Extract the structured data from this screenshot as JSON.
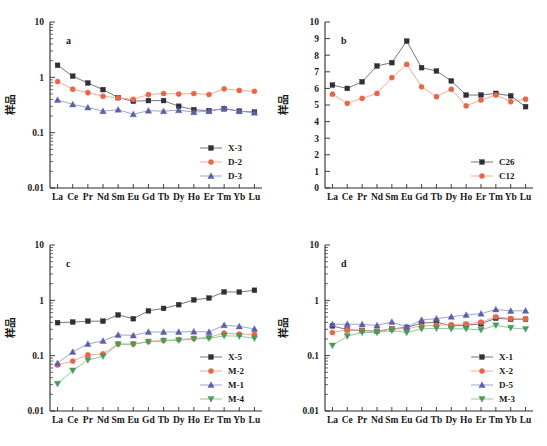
{
  "figure": {
    "axis_title": "样品",
    "categories": [
      "La",
      "Ce",
      "Pr",
      "Nd",
      "Sm",
      "Eu",
      "Gd",
      "Tb",
      "Dy",
      "Ho",
      "Er",
      "Tm",
      "Yb",
      "Lu"
    ],
    "colors": {
      "black": "#2f2f38",
      "red": "#e8674a",
      "blue": "#5a5fa8",
      "green": "#4a9a58",
      "axis": "#2a2a2a",
      "line_black": "#555560",
      "line_red": "#e8956f",
      "line_blue": "#8c90c4",
      "line_green": "#7fba88"
    }
  },
  "chart_data": [
    {
      "type": "line",
      "panel": "a",
      "title": "a",
      "xlabel": "",
      "ylabel": "样品",
      "scale": "log",
      "ylim": [
        0.01,
        10
      ],
      "yticks": [
        0.01,
        0.1,
        1,
        10
      ],
      "ytick_labels": [
        "0.01",
        "0.1",
        "1",
        "10"
      ],
      "categories": [
        "La",
        "Ce",
        "Pr",
        "Nd",
        "Sm",
        "Eu",
        "Gd",
        "Tb",
        "Dy",
        "Ho",
        "Er",
        "Tm",
        "Yb",
        "Lu"
      ],
      "grid": false,
      "legend_position": "bottom-right",
      "series": [
        {
          "name": "X-3",
          "marker": "square",
          "color": "#2f2f38",
          "values": [
            1.65,
            1.05,
            0.79,
            0.6,
            0.43,
            0.37,
            0.38,
            0.38,
            0.3,
            0.26,
            0.25,
            0.27,
            0.245,
            0.235
          ]
        },
        {
          "name": "D-2",
          "marker": "circle",
          "color": "#e8674a",
          "values": [
            0.84,
            0.61,
            0.53,
            0.455,
            0.425,
            0.4,
            0.49,
            0.51,
            0.5,
            0.51,
            0.49,
            0.62,
            0.58,
            0.56
          ]
        },
        {
          "name": "D-3",
          "marker": "triangle",
          "color": "#5a5fa8",
          "values": [
            0.39,
            0.325,
            0.285,
            0.245,
            0.26,
            0.215,
            0.25,
            0.245,
            0.255,
            0.235,
            0.245,
            0.275,
            0.245,
            0.23
          ]
        }
      ]
    },
    {
      "type": "line",
      "panel": "b",
      "title": "b",
      "xlabel": "",
      "ylabel": "样品",
      "scale": "linear",
      "ylim": [
        0,
        10
      ],
      "yticks": [
        0,
        1,
        2,
        3,
        4,
        5,
        6,
        7,
        8,
        9,
        10
      ],
      "ytick_labels": [
        "0",
        "1",
        "2",
        "3",
        "4",
        "5",
        "6",
        "7",
        "8",
        "9",
        "10"
      ],
      "categories": [
        "La",
        "Ce",
        "Pr",
        "Nd",
        "Sm",
        "Eu",
        "Gd",
        "Tb",
        "Dy",
        "Ho",
        "Er",
        "Tm",
        "Yb",
        "Lu"
      ],
      "grid": false,
      "legend_position": "bottom-right",
      "series": [
        {
          "name": "C26",
          "marker": "square",
          "color": "#2f2f38",
          "values": [
            6.2,
            6.0,
            6.4,
            7.35,
            7.55,
            8.85,
            7.25,
            7.05,
            6.45,
            5.6,
            5.6,
            5.7,
            5.55,
            4.9,
            5.6
          ]
        },
        {
          "name": "C12",
          "marker": "circle",
          "color": "#e8674a",
          "values": [
            5.65,
            5.1,
            5.4,
            5.7,
            6.65,
            7.45,
            6.1,
            5.5,
            5.95,
            4.95,
            5.3,
            5.6,
            5.2,
            5.35,
            5.55
          ]
        }
      ]
    },
    {
      "type": "line",
      "panel": "c",
      "title": "c",
      "xlabel": "",
      "ylabel": "样品",
      "scale": "log",
      "ylim": [
        0.01,
        10
      ],
      "yticks": [
        0.01,
        0.1,
        1,
        10
      ],
      "ytick_labels": [
        "0.01",
        "0.1",
        "1",
        "10"
      ],
      "categories": [
        "La",
        "Ce",
        "Pr",
        "Nd",
        "Sm",
        "Eu",
        "Gd",
        "Tb",
        "Dy",
        "Ho",
        "Er",
        "Tm",
        "Yb",
        "Lu"
      ],
      "grid": false,
      "legend_position": "bottom-right",
      "series": [
        {
          "name": "X-5",
          "marker": "square",
          "color": "#2f2f38",
          "values": [
            0.395,
            0.405,
            0.42,
            0.42,
            0.545,
            0.465,
            0.645,
            0.715,
            0.835,
            1.02,
            1.1,
            1.42,
            1.41,
            1.52
          ]
        },
        {
          "name": "M-2",
          "marker": "circle",
          "color": "#e8674a",
          "values": [
            0.068,
            0.08,
            0.103,
            0.108,
            0.163,
            0.163,
            0.18,
            0.19,
            0.195,
            0.205,
            0.215,
            0.255,
            0.245,
            0.245
          ]
        },
        {
          "name": "M-1",
          "marker": "triangle",
          "color": "#5a5fa8",
          "values": [
            0.073,
            0.117,
            0.163,
            0.185,
            0.238,
            0.232,
            0.268,
            0.268,
            0.268,
            0.272,
            0.268,
            0.355,
            0.338,
            0.305
          ]
        },
        {
          "name": "M-4",
          "marker": "triangle-down",
          "color": "#4a9a58",
          "values": [
            0.031,
            0.054,
            0.083,
            0.097,
            0.16,
            0.16,
            0.178,
            0.185,
            0.19,
            0.2,
            0.205,
            0.228,
            0.225,
            0.205
          ]
        }
      ]
    },
    {
      "type": "line",
      "panel": "d",
      "title": "d",
      "xlabel": "",
      "ylabel": "样品",
      "scale": "log",
      "ylim": [
        0.01,
        10
      ],
      "yticks": [
        0.01,
        0.1,
        1,
        10
      ],
      "ytick_labels": [
        "0.01",
        "0.1",
        "1",
        "10"
      ],
      "categories": [
        "La",
        "Ce",
        "Pr",
        "Nd",
        "Sm",
        "Eu",
        "Gd",
        "Tb",
        "Dy",
        "Ho",
        "Er",
        "Tm",
        "Yb",
        "Lu"
      ],
      "grid": false,
      "legend_position": "bottom-right",
      "series": [
        {
          "name": "X-1",
          "marker": "square",
          "color": "#2f2f38",
          "values": [
            0.345,
            0.295,
            0.285,
            0.275,
            0.305,
            0.325,
            0.385,
            0.405,
            0.345,
            0.355,
            0.375,
            0.475,
            0.455,
            0.455
          ]
        },
        {
          "name": "X-2",
          "marker": "circle",
          "color": "#e8674a",
          "values": [
            0.262,
            0.292,
            0.285,
            0.275,
            0.305,
            0.305,
            0.345,
            0.355,
            0.365,
            0.375,
            0.405,
            0.505,
            0.468,
            0.462
          ]
        },
        {
          "name": "D-5",
          "marker": "triangle",
          "color": "#5a5fa8",
          "values": [
            0.368,
            0.372,
            0.368,
            0.352,
            0.405,
            0.33,
            0.442,
            0.468,
            0.505,
            0.545,
            0.575,
            0.685,
            0.645,
            0.648
          ]
        },
        {
          "name": "M-3",
          "marker": "triangle-down",
          "color": "#4a9a58",
          "values": [
            0.152,
            0.225,
            0.262,
            0.262,
            0.285,
            0.262,
            0.305,
            0.312,
            0.305,
            0.305,
            0.292,
            0.352,
            0.318,
            0.302
          ]
        }
      ]
    }
  ]
}
